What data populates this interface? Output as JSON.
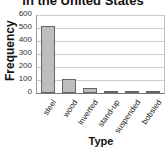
{
  "chart_data": {
    "type": "bar",
    "title_visible": "in the United States",
    "xlabel": "Type",
    "ylabel": "Frequency",
    "categories": [
      "steel",
      "wood",
      "inverted",
      "stand-up",
      "suspended",
      "bobsled"
    ],
    "values": [
      518,
      108,
      40,
      6,
      5,
      3
    ],
    "ylim": [
      0,
      600
    ],
    "yticks": [
      "0",
      "100",
      "200",
      "300",
      "400",
      "500",
      "600"
    ],
    "grid": true,
    "legend": null,
    "bar_color": "#bdbdbd"
  }
}
